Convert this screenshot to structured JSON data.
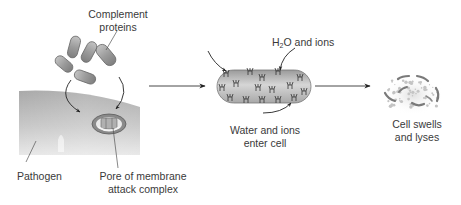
{
  "labels": {
    "complement_proteins": [
      "Complement",
      "proteins"
    ],
    "pathogen": "Pathogen",
    "pore": [
      "Pore of membrane",
      "attack complex"
    ],
    "h2o_prefix": "H",
    "h2o_sub": "2",
    "h2o_suffix": "O and ions",
    "water_ions": [
      "Water and ions",
      "enter cell"
    ],
    "lyses": [
      "Cell swells",
      "and lyses"
    ]
  },
  "stages": [
    {
      "id": "complement-binding",
      "description": "Complement proteins assemble into pore on pathogen membrane"
    },
    {
      "id": "water-entry",
      "description": "Water and ions enter cell"
    },
    {
      "id": "lysis",
      "description": "Cell swells and lyses"
    }
  ],
  "colors": {
    "protein_fill": "#9a9a9a",
    "protein_stroke": "#6b6b6b",
    "membrane_fill": "#bdbdbd",
    "arrow": "#2a2a2a",
    "text": "#3a3a3a",
    "fragment": "#7a7a7a"
  }
}
